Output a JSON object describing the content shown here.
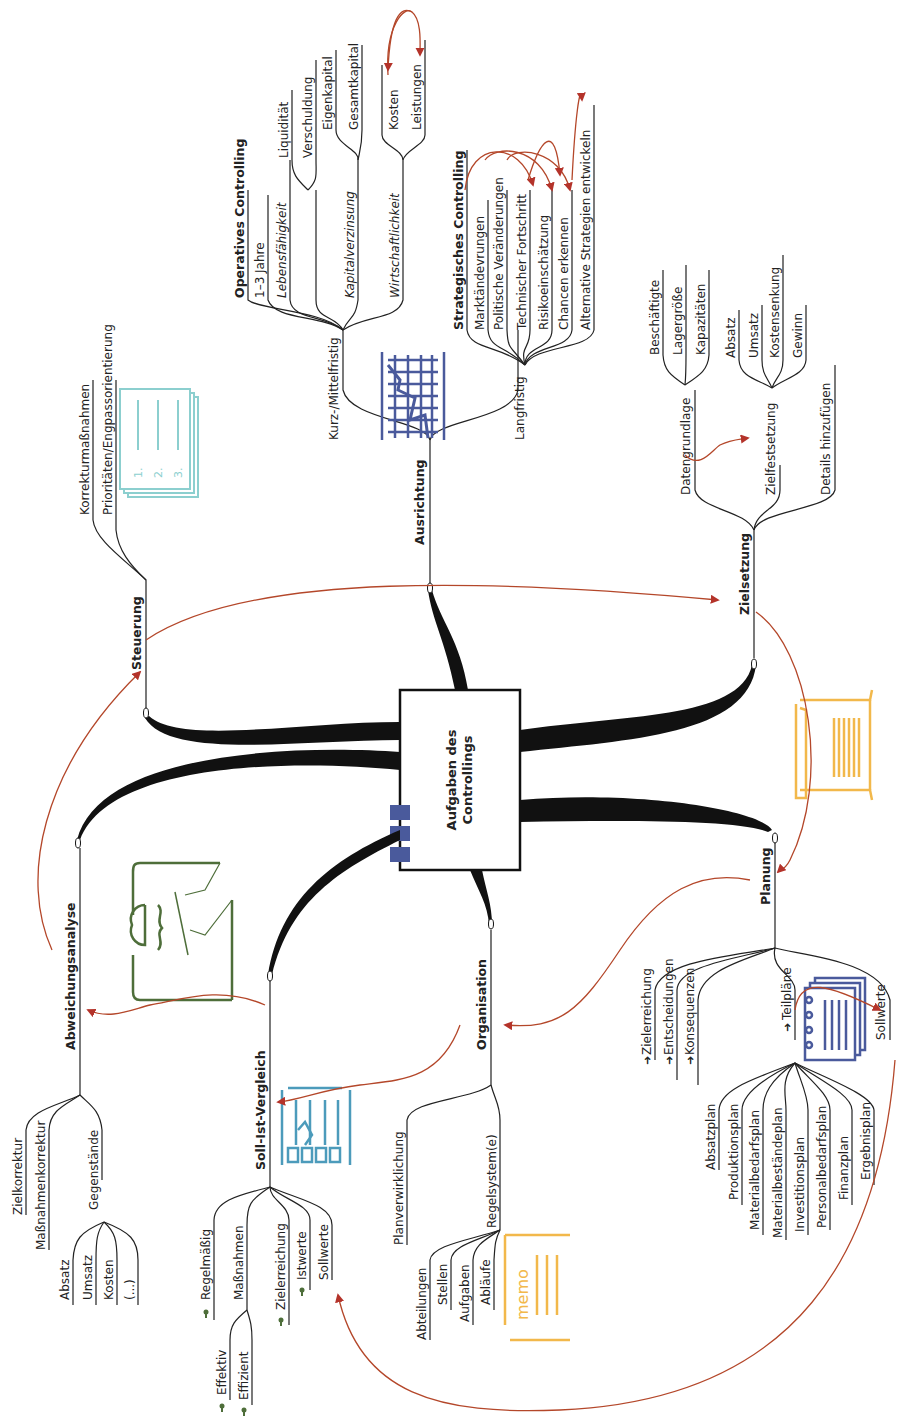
{
  "center": {
    "line1": "Aufgaben des",
    "line2": "Controllings"
  },
  "branches": {
    "ausrichtung": {
      "label": "Ausrichtung",
      "kurz": {
        "label": "Kurz-/Mittelfristig",
        "title": "Operatives Controlling",
        "jahre": "1–3 Jahre",
        "lebens": {
          "label": "Lebensfähigkeit",
          "items": [
            "Liquidität",
            "Verschuldung"
          ]
        },
        "kapital": {
          "label": "Kapitalverzinsung",
          "items": [
            "Eigenkapital",
            "Gesamtkapital"
          ]
        },
        "wirtschaft": {
          "label": "Wirtschaftlichkeit",
          "items": [
            "Kosten",
            "Leistungen"
          ]
        }
      },
      "lang": {
        "label": "Langfristig",
        "title": "Strategisches Controlling",
        "items": [
          "Marktändevrungen",
          "Politische Veränderungen",
          "Technischer Fortschritt",
          "Risikoeinschätzung",
          "Chancen erkennen",
          "Alternative Strategien entwickeln"
        ]
      }
    },
    "zielsetzung": {
      "label": "Zielsetzung",
      "datengrundlage": {
        "label": "Datengrundlage",
        "items": [
          "Beschäftigte",
          "Lagergröße",
          "Kapazitäten"
        ]
      },
      "zielfestsetzung": {
        "label": "Zielfestsetzung",
        "items": [
          "Absatz",
          "Umsatz",
          "Kostensenkung",
          "Gewinn"
        ]
      },
      "details": "Details hinzufügen"
    },
    "planung": {
      "label": "Planung",
      "items": [
        "Zielerreichung",
        "Entscheidungen",
        "Konsequenzen"
      ],
      "teilplaene": {
        "label": "Teilpläne",
        "items": [
          "Absatzplan",
          "Produktionsplan",
          "Materialbedarfsplan",
          "Materialbeständeplan",
          "Investitionsplan",
          "Personalbedarfsplan",
          "Finanzplan",
          "Ergebnisplan"
        ]
      },
      "sollwerte": "Sollwerte"
    },
    "organisation": {
      "label": "Organisation",
      "planverwirklichung": "Planverwirklichung",
      "regelsystem": {
        "label": "Regelsystem(e)",
        "items": [
          "Abteilungen",
          "Stellen",
          "Aufgaben",
          "Abläufe"
        ]
      }
    },
    "sollist": {
      "label": "Soll-Ist-Vergleich",
      "regelmaessig": "Regelmäßig",
      "massnahmen": {
        "label": "Maßnahmen",
        "items": [
          "Effektiv",
          "Effizient"
        ]
      },
      "items": [
        "Zielerreichung",
        "Istwerte",
        "Sollwerte"
      ]
    },
    "abweichung": {
      "label": "Abweichungsanalyse",
      "items": [
        "Zielkorrektur",
        "Maßnahmenkorrektur"
      ],
      "gegenstaende": {
        "label": "Gegenstände",
        "items": [
          "Absatz",
          "Umsatz",
          "Kosten",
          "(...)"
        ]
      }
    },
    "steuerung": {
      "label": "Steuerung",
      "items": [
        "Korrekturmaßnahmen",
        "Prioritäten/Engpassorientierung"
      ]
    }
  },
  "icons": {
    "memo_text": "memo",
    "list_numbers": [
      "1.",
      "2.",
      "3."
    ]
  },
  "colors": {
    "arrow": "#b4472a",
    "chart_icon": "#4a5a9c",
    "list_icon": "#8ccfcf",
    "memo_icon": "#f2b84b",
    "note_icon": "#4e6e3a",
    "compare_icon": "#4c9bbb",
    "plans_icon": "#4a5a9c"
  }
}
